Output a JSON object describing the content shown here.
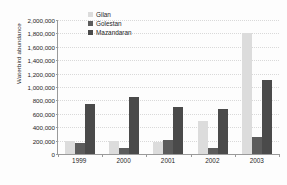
{
  "chart_data": {
    "type": "bar",
    "title": "",
    "subtitle": "",
    "xlabel": "",
    "ylabel": "Waterbird abundance",
    "categories": [
      "1999",
      "2000",
      "2001",
      "2002",
      "2003"
    ],
    "series": [
      {
        "name": "Gilan",
        "color": "#dcdcdc",
        "values": [
          200000,
          190000,
          175000,
          500000,
          1800000
        ]
      },
      {
        "name": "Golestan",
        "color": "#5c5c5c",
        "values": [
          165000,
          95000,
          205000,
          95000,
          250000
        ]
      },
      {
        "name": "Mazandaran",
        "color": "#4a4a4a",
        "values": [
          745000,
          850000,
          695000,
          675000,
          1100000
        ]
      }
    ],
    "ylim": [
      0,
      2000000
    ],
    "ytick_step": 200000,
    "ytick_labels": [
      "0",
      "200,000",
      "400,000",
      "600,000",
      "800,000",
      "1,000,000",
      "1,200,000",
      "1,400,000",
      "1,600,000",
      "1,800,000",
      "2,000,000"
    ],
    "ytick_values": [
      0,
      200000,
      400000,
      600000,
      800000,
      1000000,
      1200000,
      1400000,
      1600000,
      1800000,
      2000000
    ],
    "grid": true,
    "legend_position": "top-left-inside",
    "bar_group_mode": "grouped",
    "background_color": "#fdfdfd",
    "axis_color": "#9a9a9a"
  }
}
